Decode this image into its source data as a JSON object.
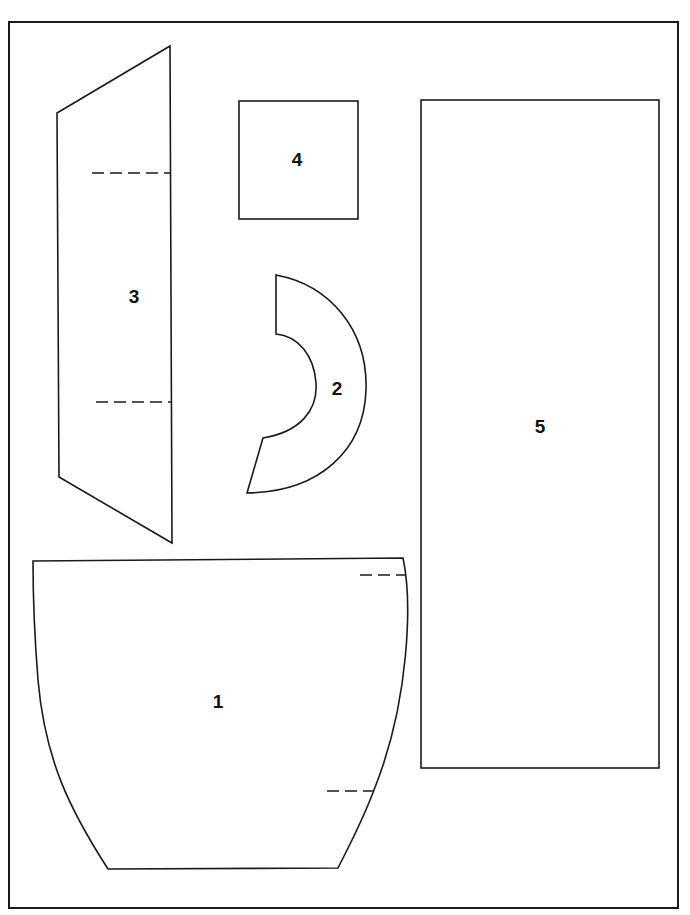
{
  "diagram": {
    "type": "pattern-pieces",
    "colors": {
      "line": "#1a1a1a",
      "background": "#ffffff",
      "label": "#111111"
    },
    "pieces": [
      {
        "id": "1",
        "label": "1",
        "shape": "curved-sided trapezoid (bowl/body)",
        "fold_marks": 2
      },
      {
        "id": "2",
        "label": "2",
        "shape": "crescent / ring segment",
        "fold_marks": 0
      },
      {
        "id": "3",
        "label": "3",
        "shape": "angled strip (trapezoid)",
        "fold_marks": 2
      },
      {
        "id": "4",
        "label": "4",
        "shape": "square",
        "fold_marks": 0
      },
      {
        "id": "5",
        "label": "5",
        "shape": "tall rectangle",
        "fold_marks": 0
      }
    ]
  }
}
